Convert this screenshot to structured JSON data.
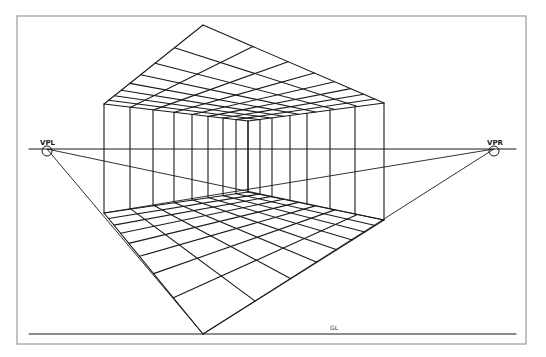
{
  "drawing": {
    "title": "Two-point perspective interior grid",
    "frame": {
      "x": 17,
      "y": 16,
      "w": 509,
      "h": 328
    },
    "horizon_line": {
      "y": 149,
      "x1": 29,
      "x2": 516
    },
    "ground_line": {
      "y": 334,
      "x1": 29,
      "x2": 516,
      "label": "GL",
      "label_x": 330,
      "label_y": 330
    },
    "vanishing_points": [
      {
        "id": "left",
        "label": "VPL",
        "x": 47,
        "y": 149
      },
      {
        "id": "right",
        "label": "VPR",
        "x": 494,
        "y": 149
      }
    ],
    "ceiling": {
      "front": [
        203,
        25
      ],
      "left": [
        104,
        104
      ],
      "back": [
        248,
        121
      ],
      "right": [
        384,
        103
      ],
      "divisions": 8
    },
    "floor": {
      "front": [
        203,
        334
      ],
      "left": [
        104,
        213
      ],
      "back": [
        248,
        192
      ],
      "right": [
        384,
        220
      ],
      "divisions": 8
    },
    "left_wall_verticals_x": [
      104,
      130,
      153,
      174,
      192,
      208,
      223,
      236,
      248
    ],
    "right_wall_verticals_x": [
      248,
      260,
      272,
      290,
      307,
      330,
      355,
      384
    ],
    "construction_lines": [
      {
        "from": "VPL",
        "to": [
          203,
          334
        ]
      },
      {
        "from": "VPL",
        "to": [
          384,
          220
        ]
      },
      {
        "from": "VPR",
        "to": [
          203,
          334
        ]
      },
      {
        "from": "VPR",
        "to": [
          104,
          213
        ]
      }
    ],
    "colors": {
      "ink": "#1a1a1a",
      "frame": "#9a9a9a",
      "paper": "#ffffff"
    }
  }
}
